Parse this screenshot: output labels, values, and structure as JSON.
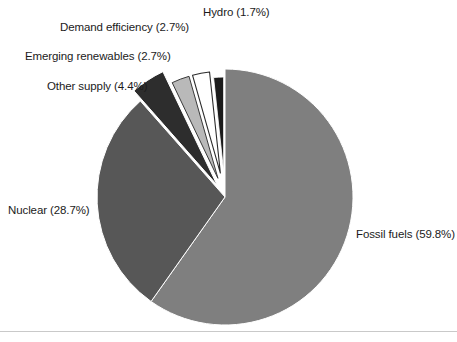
{
  "chart_data": {
    "type": "pie",
    "title": "",
    "subtitle": "",
    "xlabel": "",
    "ylabel": "",
    "legend_position": "none",
    "labels_position": "outside-callout",
    "grid": false,
    "total_percent": 100.0,
    "categories": [
      "Fossil fuels",
      "Nuclear",
      "Other supply",
      "Emerging renewables",
      "Demand efficiency",
      "Hydro"
    ],
    "values": [
      59.8,
      28.7,
      4.4,
      2.7,
      2.7,
      1.7
    ],
    "value_unit": "%",
    "slices": [
      {
        "name": "Fossil fuels",
        "value": 59.8,
        "label": "Fossil fuels (59.8%)",
        "color": "#7f7f7f",
        "exploded": false
      },
      {
        "name": "Nuclear",
        "value": 28.7,
        "label": "Nuclear (28.7%)",
        "color": "#575757",
        "exploded": false
      },
      {
        "name": "Other supply",
        "value": 4.4,
        "label": "Other supply (4.4%)",
        "color": "#2d2d2d",
        "exploded": true
      },
      {
        "name": "Emerging renewables",
        "value": 2.7,
        "label": "Emerging renewables (2.7%)",
        "color": "#b9b9b9",
        "exploded": true
      },
      {
        "name": "Demand efficiency",
        "value": 2.7,
        "label": "Demand efficiency (2.7%)",
        "color": "#ffffff",
        "exploded": true
      },
      {
        "name": "Hydro",
        "value": 1.7,
        "label": "Hydro (1.7%)",
        "color": "#1b1b1b",
        "exploded": true
      }
    ]
  },
  "figure": {
    "background_color": "#ffffff",
    "text_color": "#1b1b1b",
    "rule_color": "#c9c9c9"
  }
}
